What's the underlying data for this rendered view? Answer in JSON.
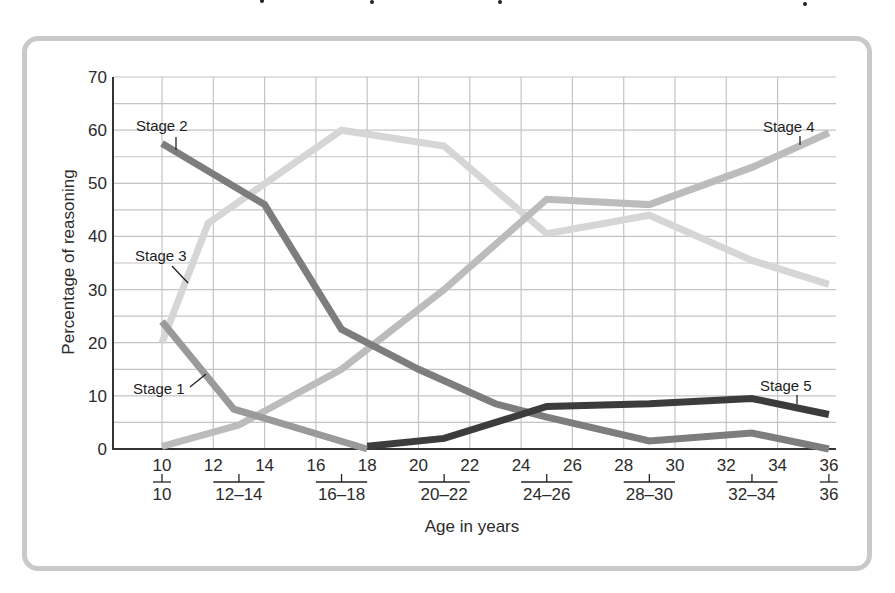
{
  "chart_data": {
    "type": "line",
    "title": "",
    "xlabel": "Age in years",
    "ylabel": "Percentage of reasoning",
    "xlim": [
      8,
      36
    ],
    "ylim": [
      0,
      70
    ],
    "grid": true,
    "legend_position": "inline-annotations",
    "x_ticks": [
      10,
      12,
      14,
      16,
      18,
      20,
      22,
      24,
      26,
      28,
      30,
      32,
      34,
      36
    ],
    "y_ticks": [
      0,
      10,
      20,
      30,
      40,
      50,
      60,
      70
    ],
    "age_groups": [
      "10",
      "12–14",
      "16–18",
      "20–22",
      "24–26",
      "28–30",
      "32–34",
      "36"
    ],
    "series": [
      {
        "name": "Stage 1",
        "color": "#9a9a9a",
        "x": [
          10,
          12.8,
          18
        ],
        "values": [
          24,
          7.5,
          0
        ]
      },
      {
        "name": "Stage 2",
        "color": "#7d7d7d",
        "x": [
          10,
          14,
          17,
          20,
          23,
          25,
          29,
          33,
          36
        ],
        "values": [
          57.5,
          46,
          22.5,
          15,
          8.5,
          6,
          1.5,
          3,
          0
        ]
      },
      {
        "name": "Stage 3",
        "color": "#d6d6d6",
        "x": [
          10,
          11.8,
          17,
          21,
          25,
          29,
          33,
          36
        ],
        "values": [
          20,
          42.5,
          60,
          57,
          40.5,
          44,
          35.5,
          31
        ]
      },
      {
        "name": "Stage 4",
        "color": "#bcbcbc",
        "x": [
          10,
          13,
          17,
          21,
          25,
          29,
          33,
          36
        ],
        "values": [
          0.5,
          4.5,
          15,
          30,
          47,
          46,
          53,
          59.5
        ]
      },
      {
        "name": "Stage 5",
        "color": "#3c3c3c",
        "x": [
          18,
          21,
          25,
          29,
          33,
          36
        ],
        "values": [
          0.5,
          2,
          8,
          8.5,
          9.5,
          6.5
        ]
      }
    ],
    "annotations": [
      "Stage 1",
      "Stage 2",
      "Stage 3",
      "Stage 4",
      "Stage 5"
    ]
  },
  "labels": {
    "ylabel": "Percentage of reasoning",
    "xlabel": "Age in years",
    "stage1": "Stage 1",
    "stage2": "Stage 2",
    "stage3": "Stage 3",
    "stage4": "Stage 4",
    "stage5": "Stage 5"
  },
  "y_tick_labels": [
    "0",
    "10",
    "20",
    "30",
    "40",
    "50",
    "60",
    "70"
  ],
  "x_tick_labels": [
    "10",
    "12",
    "14",
    "16",
    "18",
    "20",
    "22",
    "24",
    "26",
    "28",
    "30",
    "32",
    "34",
    "36"
  ],
  "group_labels": [
    "10",
    "12–14",
    "16–18",
    "20–22",
    "24–26",
    "28–30",
    "32–34",
    "36"
  ]
}
